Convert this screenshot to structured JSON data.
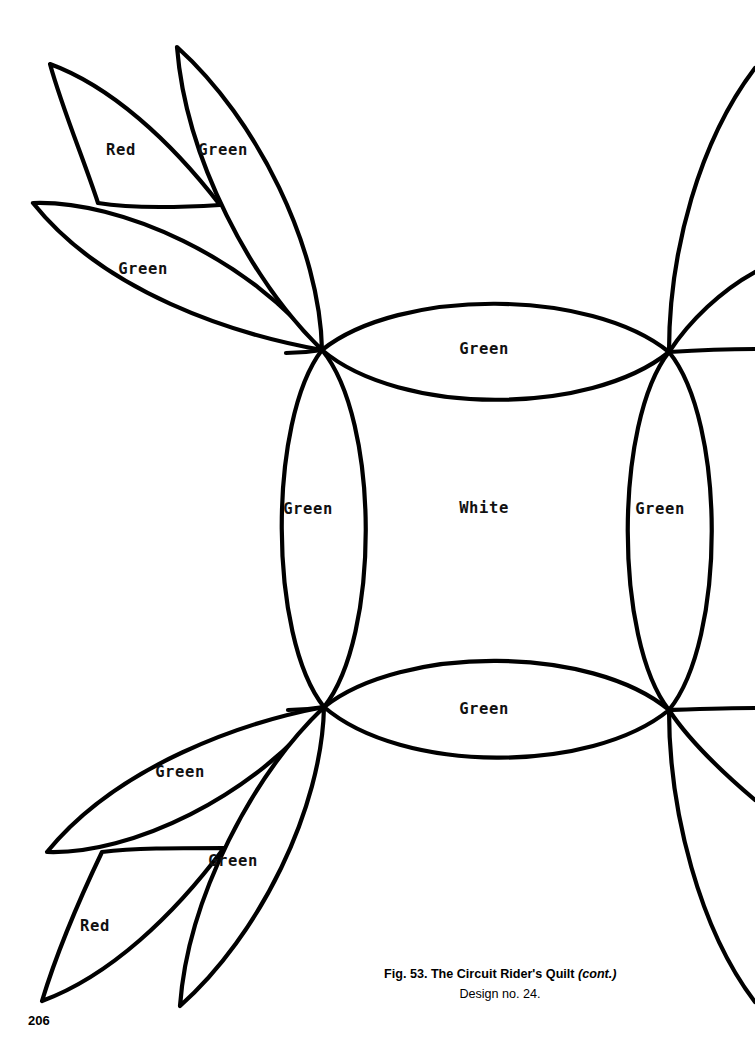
{
  "page": {
    "number": "206",
    "background_color": "#ffffff",
    "ink_color": "#000000"
  },
  "caption": {
    "figure_text": "Fig. 53. The Circuit Rider's Quilt ",
    "cont_text": "(cont.)",
    "design_text": "Design no. 24."
  },
  "diagram": {
    "labels": {
      "top_left_petal_outer": "Red",
      "top_left_petal_upper": "Green",
      "top_left_petal_lower": "Green",
      "center_top_lens": "Green",
      "center_left_lens": "Green",
      "center_square": "White",
      "center_right_lens": "Green",
      "center_bottom_lens": "Green",
      "bottom_left_petal_upper": "Green",
      "bottom_left_petal_lower": "Green",
      "bottom_left_petal_outer": "Red"
    },
    "label_positions": {
      "top_left_petal_outer": [
        121,
        150
      ],
      "top_left_petal_upper": [
        223,
        150
      ],
      "top_left_petal_lower": [
        143,
        269
      ],
      "center_top_lens": [
        484,
        349
      ],
      "center_left_lens": [
        308,
        509
      ],
      "center_square": [
        484,
        508
      ],
      "center_right_lens": [
        660,
        509
      ],
      "center_bottom_lens": [
        484,
        709
      ],
      "bottom_left_petal_upper": [
        180,
        772
      ],
      "bottom_left_petal_lower": [
        233,
        861
      ],
      "bottom_left_petal_outer": [
        95,
        926
      ]
    },
    "nodes": {
      "top_left": [
        322,
        350
      ],
      "top_right": [
        669,
        352
      ],
      "bottom_left": [
        324,
        707
      ],
      "bottom_right": [
        669,
        710
      ]
    }
  }
}
